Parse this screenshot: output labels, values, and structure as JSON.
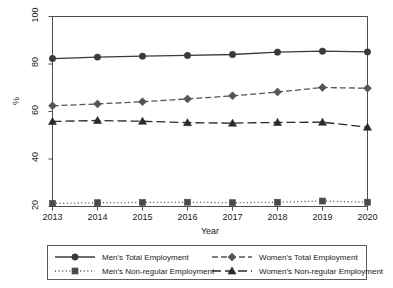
{
  "chart_data": {
    "type": "line",
    "title": "",
    "xlabel": "Year",
    "ylabel": "%",
    "categories": [
      "2013",
      "2014",
      "2015",
      "2016",
      "2017",
      "2018",
      "2019",
      "2020"
    ],
    "x": [
      2013,
      2014,
      2015,
      2016,
      2017,
      2018,
      2019,
      2020
    ],
    "xlim": [
      2013,
      2020
    ],
    "ylim": [
      20,
      100
    ],
    "yticks": [
      20,
      40,
      60,
      80,
      100
    ],
    "ytick_labels": [
      "20",
      "40",
      "60",
      "80",
      "100"
    ],
    "grid": false,
    "legend_position": "below-axes",
    "series": [
      {
        "name": "Men's Total Employment",
        "marker": "circle",
        "line_style": "solid",
        "color": "#3a3a3a",
        "values": [
          82.3,
          82.9,
          83.3,
          83.6,
          84.0,
          85.0,
          85.4,
          85.1
        ]
      },
      {
        "name": "Women's Total Employment",
        "marker": "diamond",
        "line_style": "dashed",
        "color": "#555555",
        "values": [
          62.4,
          63.2,
          64.1,
          65.3,
          66.6,
          68.2,
          70.1,
          69.8
        ]
      },
      {
        "name": "Men's Non-regular Employment",
        "marker": "square",
        "line_style": "dotted",
        "color": "#4a4a4a",
        "values": [
          21.3,
          21.6,
          21.7,
          21.8,
          21.6,
          21.8,
          22.3,
          21.8
        ]
      },
      {
        "name": "Women's Non-regular Employment",
        "marker": "triangle",
        "line_style": "longdash",
        "color": "#2a2a2a",
        "values": [
          55.8,
          56.2,
          55.9,
          55.3,
          55.1,
          55.4,
          55.5,
          53.4
        ]
      }
    ]
  },
  "legend": {
    "entries": [
      {
        "label": "Men's Total Employment"
      },
      {
        "label": "Women's Total Employment"
      },
      {
        "label": "Men's Non-regular Employment"
      },
      {
        "label": "Women's Non-regular Employment"
      }
    ]
  },
  "axes": {
    "y_title": "%",
    "x_title": "Year"
  }
}
